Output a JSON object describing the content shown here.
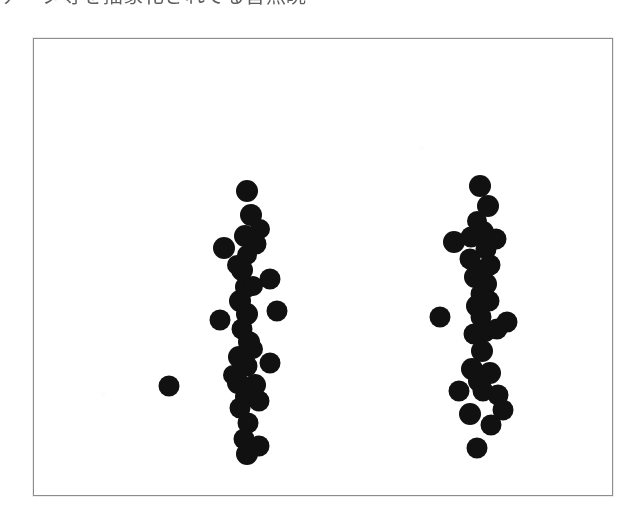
{
  "page": {
    "background_color": "#ffffff",
    "caption_text": "データ等を描象化されてる皆無眺"
  },
  "figure": {
    "frame_color": "#8d8d8d",
    "background_color": "#ffffff",
    "dot_color": "#111111"
  },
  "chart_data": {
    "type": "scatter",
    "title": "",
    "subtitle": "",
    "xlabel": "",
    "ylabel": "",
    "grid": false,
    "legend": null,
    "axes_visible": false,
    "frame": true,
    "xlim": [
      0,
      580
    ],
    "ylim": [
      0,
      458
    ],
    "y_axis_inverted": false,
    "marker": {
      "shape": "circle",
      "color": "#111111",
      "diameter_px": 21,
      "filled": true
    },
    "categories": [
      "group-left",
      "group-right"
    ],
    "series": [
      {
        "name": "group-left",
        "center_x": 211,
        "count": 33,
        "points": [
          {
            "x": 213,
            "y": 152,
            "d": 22
          },
          {
            "x": 217,
            "y": 176,
            "d": 22
          },
          {
            "x": 226,
            "y": 190,
            "d": 20
          },
          {
            "x": 211,
            "y": 197,
            "d": 22
          },
          {
            "x": 222,
            "y": 205,
            "d": 21
          },
          {
            "x": 190,
            "y": 209,
            "d": 22
          },
          {
            "x": 213,
            "y": 216,
            "d": 20
          },
          {
            "x": 208,
            "y": 231,
            "d": 22
          },
          {
            "x": 236,
            "y": 240,
            "d": 21
          },
          {
            "x": 212,
            "y": 248,
            "d": 22
          },
          {
            "x": 206,
            "y": 262,
            "d": 22
          },
          {
            "x": 243,
            "y": 272,
            "d": 21
          },
          {
            "x": 213,
            "y": 275,
            "d": 22
          },
          {
            "x": 186,
            "y": 281,
            "d": 21
          },
          {
            "x": 208,
            "y": 290,
            "d": 21
          },
          {
            "x": 215,
            "y": 303,
            "d": 22
          },
          {
            "x": 205,
            "y": 318,
            "d": 22
          },
          {
            "x": 236,
            "y": 324,
            "d": 21
          },
          {
            "x": 213,
            "y": 327,
            "d": 21
          },
          {
            "x": 135,
            "y": 347,
            "d": 21
          },
          {
            "x": 204,
            "y": 344,
            "d": 22
          },
          {
            "x": 221,
            "y": 346,
            "d": 22
          },
          {
            "x": 212,
            "y": 358,
            "d": 22
          },
          {
            "x": 225,
            "y": 362,
            "d": 21
          },
          {
            "x": 206,
            "y": 369,
            "d": 21
          },
          {
            "x": 214,
            "y": 384,
            "d": 21
          },
          {
            "x": 210,
            "y": 400,
            "d": 21
          },
          {
            "x": 225,
            "y": 407,
            "d": 21
          },
          {
            "x": 213,
            "y": 415,
            "d": 22
          },
          {
            "x": 219,
            "y": 247,
            "d": 20
          },
          {
            "x": 203,
            "y": 226,
            "d": 20
          },
          {
            "x": 219,
            "y": 310,
            "d": 20
          },
          {
            "x": 199,
            "y": 336,
            "d": 20
          }
        ]
      },
      {
        "name": "group-right",
        "center_x": 447,
        "count": 33,
        "points": [
          {
            "x": 446,
            "y": 147,
            "d": 22
          },
          {
            "x": 454,
            "y": 167,
            "d": 22
          },
          {
            "x": 443,
            "y": 182,
            "d": 20
          },
          {
            "x": 449,
            "y": 193,
            "d": 22
          },
          {
            "x": 437,
            "y": 198,
            "d": 21
          },
          {
            "x": 462,
            "y": 200,
            "d": 21
          },
          {
            "x": 420,
            "y": 203,
            "d": 22
          },
          {
            "x": 452,
            "y": 210,
            "d": 21
          },
          {
            "x": 436,
            "y": 220,
            "d": 21
          },
          {
            "x": 456,
            "y": 226,
            "d": 21
          },
          {
            "x": 441,
            "y": 238,
            "d": 22
          },
          {
            "x": 452,
            "y": 245,
            "d": 22
          },
          {
            "x": 447,
            "y": 255,
            "d": 21
          },
          {
            "x": 455,
            "y": 262,
            "d": 21
          },
          {
            "x": 443,
            "y": 267,
            "d": 22
          },
          {
            "x": 406,
            "y": 278,
            "d": 21
          },
          {
            "x": 447,
            "y": 278,
            "d": 21
          },
          {
            "x": 473,
            "y": 283,
            "d": 21
          },
          {
            "x": 451,
            "y": 292,
            "d": 22
          },
          {
            "x": 440,
            "y": 295,
            "d": 21
          },
          {
            "x": 463,
            "y": 290,
            "d": 21
          },
          {
            "x": 448,
            "y": 312,
            "d": 22
          },
          {
            "x": 438,
            "y": 330,
            "d": 22
          },
          {
            "x": 456,
            "y": 334,
            "d": 22
          },
          {
            "x": 445,
            "y": 342,
            "d": 22
          },
          {
            "x": 425,
            "y": 352,
            "d": 21
          },
          {
            "x": 449,
            "y": 352,
            "d": 21
          },
          {
            "x": 464,
            "y": 356,
            "d": 21
          },
          {
            "x": 436,
            "y": 375,
            "d": 22
          },
          {
            "x": 469,
            "y": 371,
            "d": 21
          },
          {
            "x": 457,
            "y": 386,
            "d": 21
          },
          {
            "x": 443,
            "y": 409,
            "d": 21
          },
          {
            "x": 450,
            "y": 230,
            "d": 20
          }
        ]
      }
    ]
  }
}
